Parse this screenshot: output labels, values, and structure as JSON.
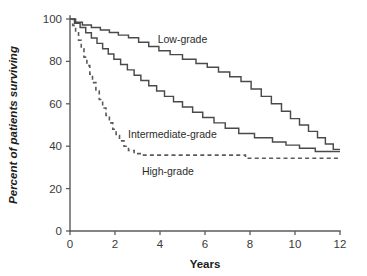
{
  "chart_data": {
    "type": "line",
    "subtype": "kaplan-meier-survival-step",
    "title": "",
    "xlabel": "Years",
    "ylabel": "Percent of patients surviving",
    "xlim": [
      0,
      12
    ],
    "ylim": [
      0,
      100
    ],
    "xticks": [
      0,
      2,
      4,
      6,
      8,
      10,
      12
    ],
    "xtick_labels": [
      "0",
      "2",
      "4",
      "6",
      "8",
      "10",
      "12"
    ],
    "yticks": [
      0,
      20,
      40,
      60,
      80,
      100
    ],
    "ytick_labels": [
      "0",
      "20",
      "40",
      "60",
      "80",
      "100"
    ],
    "grid": false,
    "legend_position": "inline-annotations",
    "colors": {
      "axis": "#5b5b5b",
      "curve": "#4a4a4a",
      "curve_dashed": "#5a5a5a",
      "text": "#1c1c1c"
    },
    "series": [
      {
        "name": "Low-grade",
        "style": "solid",
        "label": "Low-grade",
        "label_x": 5.0,
        "label_y": 88.5,
        "points": [
          [
            0.0,
            100
          ],
          [
            0.25,
            100
          ],
          [
            0.25,
            98.5
          ],
          [
            0.55,
            98.5
          ],
          [
            0.55,
            97.2
          ],
          [
            0.95,
            97.2
          ],
          [
            0.95,
            96.0
          ],
          [
            1.35,
            96.0
          ],
          [
            1.35,
            94.8
          ],
          [
            1.75,
            94.8
          ],
          [
            1.75,
            93.6
          ],
          [
            2.15,
            93.6
          ],
          [
            2.15,
            92.4
          ],
          [
            2.6,
            92.4
          ],
          [
            2.6,
            91.2
          ],
          [
            3.05,
            91.2
          ],
          [
            3.05,
            89.0
          ],
          [
            3.5,
            89.0
          ],
          [
            3.5,
            87.0
          ],
          [
            3.95,
            87.0
          ],
          [
            3.95,
            85.0
          ],
          [
            4.45,
            85.0
          ],
          [
            4.45,
            83.2
          ],
          [
            5.0,
            83.2
          ],
          [
            5.0,
            81.0
          ],
          [
            5.6,
            81.0
          ],
          [
            5.6,
            79.0
          ],
          [
            6.1,
            79.0
          ],
          [
            6.1,
            77.2
          ],
          [
            6.6,
            77.2
          ],
          [
            6.6,
            75.0
          ],
          [
            7.1,
            75.0
          ],
          [
            7.1,
            72.8
          ],
          [
            7.6,
            72.8
          ],
          [
            7.6,
            70.5
          ],
          [
            8.05,
            70.5
          ],
          [
            8.05,
            67.0
          ],
          [
            8.5,
            67.0
          ],
          [
            8.5,
            63.5
          ],
          [
            8.95,
            63.5
          ],
          [
            8.95,
            60.0
          ],
          [
            9.4,
            60.0
          ],
          [
            9.4,
            56.5
          ],
          [
            9.8,
            56.5
          ],
          [
            9.8,
            53.0
          ],
          [
            10.2,
            53.0
          ],
          [
            10.2,
            50.0
          ],
          [
            10.6,
            50.0
          ],
          [
            10.6,
            47.0
          ],
          [
            11.0,
            47.0
          ],
          [
            11.0,
            44.0
          ],
          [
            11.35,
            44.0
          ],
          [
            11.35,
            41.0
          ],
          [
            11.7,
            41.0
          ],
          [
            11.7,
            38.5
          ],
          [
            12.0,
            38.5
          ]
        ]
      },
      {
        "name": "Intermediate-grade",
        "style": "solid",
        "label": "Intermediate-grade",
        "label_x": 4.55,
        "label_y": 44.0,
        "points": [
          [
            0.0,
            100
          ],
          [
            0.2,
            100
          ],
          [
            0.2,
            98.0
          ],
          [
            0.45,
            98.0
          ],
          [
            0.45,
            96.0
          ],
          [
            0.7,
            96.0
          ],
          [
            0.7,
            93.5
          ],
          [
            0.95,
            93.5
          ],
          [
            0.95,
            91.0
          ],
          [
            1.2,
            91.0
          ],
          [
            1.2,
            88.5
          ],
          [
            1.45,
            88.5
          ],
          [
            1.45,
            86.0
          ],
          [
            1.7,
            86.0
          ],
          [
            1.7,
            83.5
          ],
          [
            1.95,
            83.5
          ],
          [
            1.95,
            81.0
          ],
          [
            2.25,
            81.0
          ],
          [
            2.25,
            78.5
          ],
          [
            2.55,
            78.5
          ],
          [
            2.55,
            76.0
          ],
          [
            2.85,
            76.0
          ],
          [
            2.85,
            73.5
          ],
          [
            3.15,
            73.5
          ],
          [
            3.15,
            71.0
          ],
          [
            3.5,
            71.0
          ],
          [
            3.5,
            68.5
          ],
          [
            3.85,
            68.5
          ],
          [
            3.85,
            66.0
          ],
          [
            4.2,
            66.0
          ],
          [
            4.2,
            63.5
          ],
          [
            4.6,
            63.5
          ],
          [
            4.6,
            61.0
          ],
          [
            5.0,
            61.0
          ],
          [
            5.0,
            58.5
          ],
          [
            5.45,
            58.5
          ],
          [
            5.45,
            56.0
          ],
          [
            5.9,
            56.0
          ],
          [
            5.9,
            53.5
          ],
          [
            6.4,
            53.5
          ],
          [
            6.4,
            51.0
          ],
          [
            6.9,
            51.0
          ],
          [
            6.9,
            48.5
          ],
          [
            7.5,
            48.5
          ],
          [
            7.5,
            46.0
          ],
          [
            8.2,
            46.0
          ],
          [
            8.2,
            44.0
          ],
          [
            9.0,
            44.0
          ],
          [
            9.0,
            42.0
          ],
          [
            9.6,
            42.0
          ],
          [
            9.6,
            40.5
          ],
          [
            10.2,
            40.5
          ],
          [
            10.2,
            39.0
          ],
          [
            10.9,
            39.0
          ],
          [
            10.9,
            37.5
          ],
          [
            12.0,
            37.5
          ]
        ]
      },
      {
        "name": "High-grade",
        "style": "dashed",
        "label": "High-grade",
        "label_x": 4.35,
        "label_y": 26.5,
        "points": [
          [
            0.0,
            100
          ],
          [
            0.12,
            100
          ],
          [
            0.12,
            97.0
          ],
          [
            0.25,
            97.0
          ],
          [
            0.25,
            93.5
          ],
          [
            0.38,
            93.5
          ],
          [
            0.38,
            90.0
          ],
          [
            0.5,
            90.0
          ],
          [
            0.5,
            86.0
          ],
          [
            0.62,
            86.0
          ],
          [
            0.62,
            82.0
          ],
          [
            0.75,
            82.0
          ],
          [
            0.75,
            78.0
          ],
          [
            0.88,
            78.0
          ],
          [
            0.88,
            74.0
          ],
          [
            1.0,
            74.0
          ],
          [
            1.0,
            70.0
          ],
          [
            1.15,
            70.0
          ],
          [
            1.15,
            66.0
          ],
          [
            1.3,
            66.0
          ],
          [
            1.3,
            62.0
          ],
          [
            1.45,
            62.0
          ],
          [
            1.45,
            58.0
          ],
          [
            1.6,
            58.0
          ],
          [
            1.6,
            54.5
          ],
          [
            1.75,
            54.5
          ],
          [
            1.75,
            51.0
          ],
          [
            1.9,
            51.0
          ],
          [
            1.9,
            48.0
          ],
          [
            2.05,
            48.0
          ],
          [
            2.05,
            45.0
          ],
          [
            2.2,
            45.0
          ],
          [
            2.2,
            42.5
          ],
          [
            2.4,
            42.5
          ],
          [
            2.4,
            40.0
          ],
          [
            2.6,
            40.0
          ],
          [
            2.6,
            38.0
          ],
          [
            2.85,
            38.0
          ],
          [
            2.85,
            36.5
          ],
          [
            3.2,
            36.5
          ],
          [
            3.2,
            35.8
          ],
          [
            7.8,
            35.8
          ],
          [
            7.8,
            34.3
          ],
          [
            12.0,
            34.3
          ]
        ]
      }
    ]
  },
  "geometry": {
    "plot_left": 70,
    "plot_right": 340,
    "plot_top": 19,
    "plot_bottom": 231
  }
}
